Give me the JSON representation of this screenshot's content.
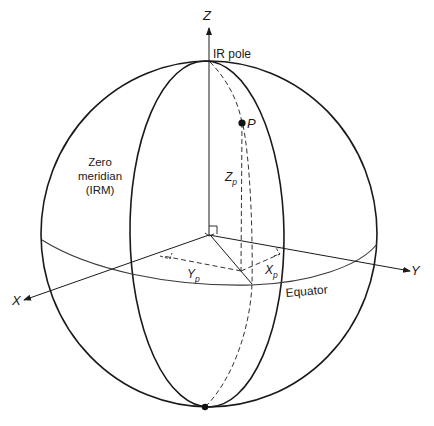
{
  "diagram": {
    "type": "celestial-reference-sphere",
    "colors": {
      "line": "#1a1a1a",
      "equator": "#3a3a3a",
      "background": "#ffffff"
    },
    "labels": {
      "z_axis": "Z",
      "x_axis": "X",
      "y_axis": "Y",
      "ir_pole": "IR pole",
      "point": "P",
      "zero_meridian_line1": "Zero",
      "zero_meridian_line2": "meridian",
      "zero_meridian_line3": "(IRM)",
      "z_p": "Z",
      "z_p_sub": "p",
      "y_p": "Y",
      "y_p_sub": "p",
      "x_p": "X",
      "x_p_sub": "p",
      "equator": "Equator"
    }
  }
}
